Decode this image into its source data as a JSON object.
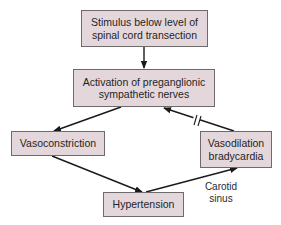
{
  "diagram": {
    "type": "flowchart",
    "colors": {
      "node_fill": "#e4d7dc",
      "node_border": "#6e6a6c",
      "edge": "#1a1a1a",
      "text": "#1f1f1f"
    },
    "nodes": {
      "stimulus": {
        "line1": "Stimulus below level of",
        "line2": "spinal cord transection"
      },
      "activation": {
        "line1": "Activation of preganglionic",
        "line2": "sympathetic nerves"
      },
      "vasoconstriction": {
        "line1": "Vasoconstriction"
      },
      "vasodilation": {
        "line1": "Vasodilation",
        "line2": "bradycardia"
      },
      "hypertension": {
        "line1": "Hypertension"
      }
    },
    "edge_labels": {
      "carotid_sinus": {
        "line1": "Carotid",
        "line2": "sinus"
      }
    },
    "edges": [
      {
        "from": "stimulus",
        "to": "activation",
        "blocked": false
      },
      {
        "from": "activation",
        "to": "vasoconstriction",
        "blocked": false
      },
      {
        "from": "vasoconstriction",
        "to": "hypertension",
        "blocked": false
      },
      {
        "from": "hypertension",
        "to": "vasodilation",
        "blocked": false,
        "label": "Carotid sinus"
      },
      {
        "from": "vasodilation",
        "to": "activation",
        "blocked": true
      }
    ]
  }
}
